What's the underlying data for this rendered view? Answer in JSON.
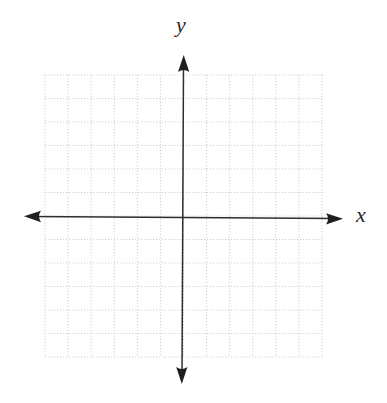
{
  "diagram": {
    "type": "coordinate-plane",
    "axes": {
      "x_label": "x",
      "y_label": "y",
      "arrows": [
        "left",
        "right",
        "up",
        "down"
      ],
      "color": "#2e2e2e"
    },
    "grid": {
      "columns": 12,
      "rows": 12,
      "style": "dotted",
      "color": "#cfcfcf",
      "origin_column": 6,
      "origin_row": 6
    },
    "background": "#ffffff"
  }
}
